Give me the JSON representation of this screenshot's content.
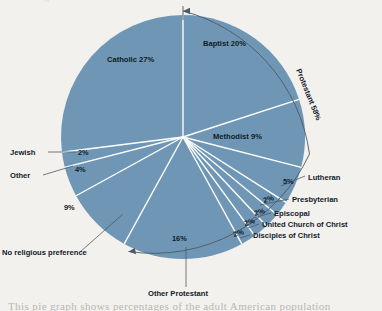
{
  "figure": {
    "title_fragment_top": "g",
    "caption_fragment_bottom": "This pie graph shows percentages of the adult American population",
    "colors": {
      "slice_fill": "#6f97b5",
      "slice_divider": "#ffffff",
      "background": "#f2f1ee",
      "leader_line": "#4b5a66",
      "label_text": "#14202b"
    }
  },
  "chart_data": {
    "type": "pie",
    "title": "",
    "legend_position": "callout-labels",
    "units": "percent",
    "categories": [
      "Baptist",
      "Methodist",
      "Lutheran",
      "Presbyterian",
      "Episcopal",
      "United Church of Christ",
      "Disciples of Christ",
      "Other Protestant",
      "No religious preference",
      "Other",
      "Jewish",
      "Catholic"
    ],
    "values": [
      20,
      9,
      5,
      2,
      2,
      2,
      2,
      16,
      9,
      4,
      2,
      27
    ],
    "slices": [
      {
        "label": "Baptist",
        "value": 20,
        "pct_text": "20%",
        "label_text": "Baptist 20%",
        "placement": "inside"
      },
      {
        "label": "Methodist",
        "value": 9,
        "pct_text": "9%",
        "label_text": "Methodist 9%",
        "placement": "inside"
      },
      {
        "label": "Lutheran",
        "value": 5,
        "pct_text": "5%",
        "label_text": "Lutheran",
        "placement": "callout-right"
      },
      {
        "label": "Presbyterian",
        "value": 2,
        "pct_text": "2%",
        "label_text": "Presbyterian",
        "placement": "callout-right"
      },
      {
        "label": "Episcopal",
        "value": 2,
        "pct_text": "2%",
        "label_text": "Episcopal",
        "placement": "callout-right"
      },
      {
        "label": "United Church of Christ",
        "value": 2,
        "pct_text": "2%",
        "label_text": "United Church of Christ",
        "placement": "callout-right"
      },
      {
        "label": "Disciples of Christ",
        "value": 2,
        "pct_text": "2%",
        "label_text": "Disciples of Christ",
        "placement": "callout-right"
      },
      {
        "label": "Other Protestant",
        "value": 16,
        "pct_text": "16%",
        "label_text": "Other Protestant",
        "placement": "callout-bottom"
      },
      {
        "label": "No religious preference",
        "value": 9,
        "pct_text": "9%",
        "label_text": "No religious preference",
        "placement": "callout-left"
      },
      {
        "label": "Other",
        "value": 4,
        "pct_text": "4%",
        "label_text": "Other",
        "placement": "callout-left"
      },
      {
        "label": "Jewish",
        "value": 2,
        "pct_text": "2%",
        "label_text": "Jewish",
        "placement": "callout-left"
      },
      {
        "label": "Catholic",
        "value": 27,
        "pct_text": "27%",
        "label_text": "Catholic 27%",
        "placement": "inside"
      }
    ],
    "groups": [
      {
        "label": "Protestant",
        "pct_text": "58%",
        "label_text": "Protestant 58%",
        "value": 58,
        "members": [
          "Baptist",
          "Methodist",
          "Lutheran",
          "Presbyterian",
          "Episcopal",
          "United Church of Christ",
          "Disciples of Christ",
          "Other Protestant"
        ],
        "bracket": "arc-right"
      }
    ]
  },
  "labels": {
    "catholic": "Catholic 27%",
    "baptist": "Baptist 20%",
    "methodist": "Methodist 9%",
    "protestant": "Protestant 58%",
    "lutheran": "Lutheran",
    "presbyterian": "Presbyterian",
    "episcopal": "Episcopal",
    "united_church_of_christ": "United Church of Christ",
    "disciples_of_christ": "Disciples of Christ",
    "other_protestant": "Other Protestant",
    "no_religious_preference": "No religious preference",
    "other": "Other",
    "jewish": "Jewish",
    "pct_lutheran": "5%",
    "pct_presbyterian": "2%",
    "pct_episcopal": "2%",
    "pct_ucc": "2%",
    "pct_disciples": "2%",
    "pct_other_protestant": "16%",
    "pct_no_pref": "9%",
    "pct_other": "4%",
    "pct_jewish": "2%"
  }
}
